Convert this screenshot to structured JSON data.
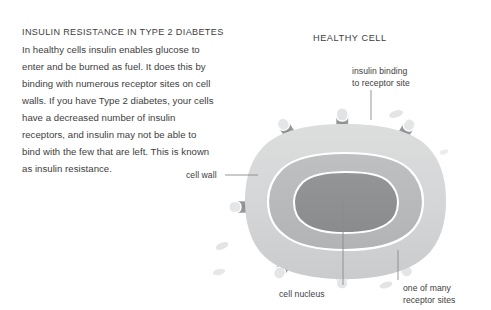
{
  "article": {
    "title": "INSULIN RESISTANCE IN TYPE 2 DIABETES",
    "body": "In healthy cells insulin enables glucose to enter and be burned as fuel. It does this by binding with numerous receptor sites on cell walls. If you have Type 2 diabetes, your cells have a decreased number of insulin receptors, and insulin may not be able to bind with the few that are left. This is known as insulin resistance."
  },
  "diagram": {
    "heading": "HEALTHY CELL",
    "labels": {
      "insulin_binding_line1": "insulin binding",
      "insulin_binding_line2": "to receptor site",
      "cell_wall": "cell wall",
      "cell_nucleus": "cell nucleus",
      "receptor_sites_line1": "one of many",
      "receptor_sites_line2": "receptor sites"
    }
  },
  "colors": {
    "background": "#ffffff",
    "text": "#3d3d3d",
    "cell_wall": "#d5d6d7",
    "cytoplasm": "#b9babb",
    "nucleus": "#8f9092",
    "receptor": "#8f9092",
    "insulin": "#e2e3e4",
    "outline": "#ffffff",
    "leader_line": "#8a8b8c"
  }
}
